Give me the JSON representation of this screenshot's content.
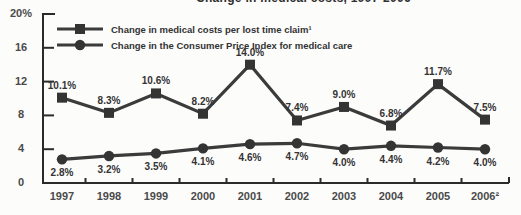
{
  "chart_data": {
    "type": "line",
    "title": "Change in medical costs, 1997-2006",
    "title_note": "partially cut off at top edge of screenshot",
    "categories": [
      "1997",
      "1998",
      "1999",
      "2000",
      "2001",
      "2002",
      "2003",
      "2004",
      "2005",
      "2006²"
    ],
    "series": [
      {
        "name": "Change in medical costs per lost time claim¹",
        "marker": "square",
        "values": [
          10.1,
          8.3,
          10.6,
          8.2,
          14.0,
          7.4,
          9.0,
          6.8,
          11.7,
          7.5
        ],
        "labels": [
          "10.1%",
          "8.3%",
          "10.6%",
          "8.2%",
          "14.0%",
          "7.4%",
          "9.0%",
          "6.8%",
          "11.7%",
          "7.5%"
        ],
        "label_position": "above"
      },
      {
        "name": "Change in the Consumer Price Index for medical care",
        "marker": "circle",
        "values": [
          2.8,
          3.2,
          3.5,
          4.1,
          4.6,
          4.7,
          4.0,
          4.4,
          4.2,
          4.0
        ],
        "labels": [
          "2.8%",
          "3.2%",
          "3.5%",
          "4.1%",
          "4.6%",
          "4.7%",
          "4.0%",
          "4.4%",
          "4.2%",
          "4.0%"
        ],
        "label_position": "below"
      }
    ],
    "y_axis": {
      "range": [
        0,
        20
      ],
      "ticks": [
        0,
        4,
        8,
        12,
        16,
        20
      ],
      "tick_labels": [
        "0",
        "4",
        "8",
        "12",
        "16",
        "20%"
      ]
    },
    "x_axis": {
      "tick_style": "interval-boundaries"
    },
    "grid": false,
    "legend_position": "top-left-inside",
    "colors": {
      "line": "#3b3b3b",
      "marker": "#343434",
      "axis": "#2b2b2b",
      "data_label": "#333333",
      "tick_label": "#4a4a4a",
      "background": "#fcfcfb"
    }
  }
}
